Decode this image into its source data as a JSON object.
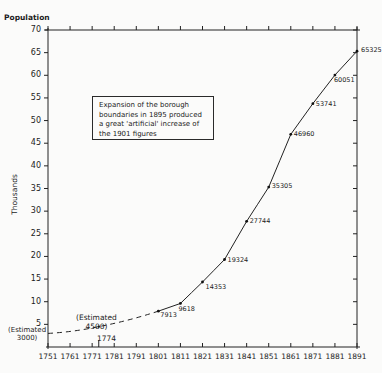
{
  "chart_data": {
    "type": "line",
    "title": "",
    "ylabel_top": "Population",
    "ylabel": "Thousands",
    "xlabel": "",
    "xlim": [
      1751,
      1891
    ],
    "ylim": [
      0,
      70
    ],
    "x_ticks": [
      "1751",
      "1761",
      "1771",
      "1781",
      "1791",
      "1801",
      "1811",
      "1821",
      "1831",
      "1841",
      "1851",
      "1861",
      "1871",
      "1881",
      "1891"
    ],
    "y_ticks": [
      "5",
      "10",
      "15",
      "20",
      "25",
      "30",
      "35",
      "40",
      "45",
      "50",
      "55",
      "60",
      "65",
      "70"
    ],
    "grid": false,
    "series": [
      {
        "name": "Estimated (dashed)",
        "style": "dashed",
        "points": [
          {
            "x": 1751,
            "y": 3.0,
            "label": "(Estimated 3000)"
          },
          {
            "x": 1774,
            "y": 4.5,
            "label": "(Estimated 4500)"
          },
          {
            "x": 1801,
            "y": 7.913,
            "label": "7913"
          }
        ]
      },
      {
        "name": "Census population (solid)",
        "style": "solid",
        "points": [
          {
            "x": 1801,
            "y": 7.913,
            "label": "7913"
          },
          {
            "x": 1811,
            "y": 9.618,
            "label": "9618"
          },
          {
            "x": 1821,
            "y": 14.353,
            "label": "14353"
          },
          {
            "x": 1831,
            "y": 19.324,
            "label": "19324"
          },
          {
            "x": 1841,
            "y": 27.744,
            "label": "27744"
          },
          {
            "x": 1851,
            "y": 35.305,
            "label": "35305"
          },
          {
            "x": 1861,
            "y": 46.96,
            "label": "46960"
          },
          {
            "x": 1871,
            "y": 53.741,
            "label": "53741"
          },
          {
            "x": 1881,
            "y": 60.051,
            "label": "60051"
          },
          {
            "x": 1891,
            "y": 65.325,
            "label": "65325"
          }
        ]
      }
    ],
    "annotations": [
      {
        "text": "Expansion of the borough boundaries in 1895 produced a great 'artificial' increase of the 1901 figures"
      },
      {
        "text": "1774",
        "x": 1774,
        "position": "below-axis-marker"
      },
      {
        "text": "(Estimated 4500)"
      },
      {
        "text": "(Estimated 3000)"
      }
    ]
  },
  "labels": {
    "population": "Population",
    "thousands": "Thousands",
    "note": "Expansion of the borough boundaries in 1895 produced a great 'artificial' increase of the 1901 figures",
    "est4500_l1": "(Estimated",
    "est4500_l2": "4500)",
    "est3000_l1": "(Estimated",
    "est3000_l2": "3000)",
    "marker1774": "1774"
  }
}
